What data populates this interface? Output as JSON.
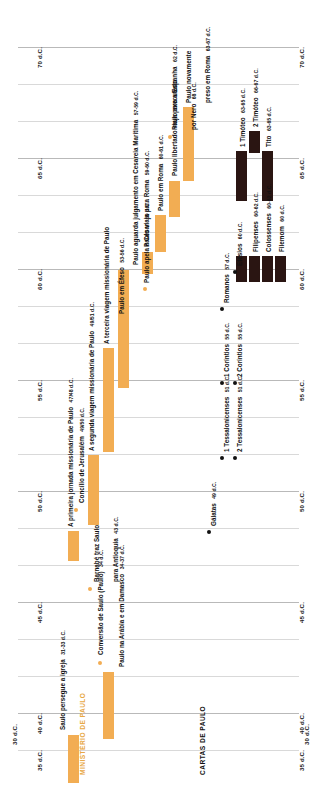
{
  "axis": {
    "unit": "d.C.",
    "ticks_left": [
      "70 d.C.",
      "65 d.C.",
      "60 d.C.",
      "55 d.C.",
      "50 d.C.",
      "45 d.C.",
      "40 d.C.",
      "35 d.C.",
      "30 d.C."
    ],
    "ticks_right": [
      "70 d.C.",
      "65 d.C.",
      "60 d.C.",
      "55 d.C.",
      "50 d.C.",
      "45 d.C.",
      "40 d.C.",
      "35 d.C.",
      "30 d.C."
    ]
  },
  "sections": {
    "ministry_title": "MINISTÉRIO DE PAULO",
    "letters_title": "CARTAS DE PAULO",
    "ministry_color": "#f2ad53",
    "letters_color": "#2a1512"
  },
  "ministry_events": [
    {
      "label": "Saulo persegue a igreja",
      "date": "31-33 d.C.",
      "marker": "bar"
    },
    {
      "label": "Conversão de Saulo (Paulo)",
      "date": "34 d.C.",
      "marker": "dot"
    },
    {
      "label": "Paulo na Arábia e em Damasco",
      "date": "34-37 d.C.",
      "marker": "bar"
    },
    {
      "label": "Barnabé traz Saulo para Antioquia",
      "date": "43 d.C.",
      "marker": "dot"
    },
    {
      "label": "A primeira jornada missionária de Paulo",
      "date": "47/48 d.C.",
      "marker": "bar"
    },
    {
      "label": "Concílio de Jerusalém",
      "date": "49/50 d.C.",
      "marker": "dot"
    },
    {
      "label": "A segunda viagem missionária de Paulo",
      "date": "49/51 d.C.",
      "marker": "bar"
    },
    {
      "label": "A terceira viagem missionária de Paulo",
      "date": "",
      "marker": "bar"
    },
    {
      "label": "Paulo em Éfeso",
      "date": "53-56 d.C.",
      "marker": "bar"
    },
    {
      "label": "Paulo aguarda julgamento em Cesareia Marítima",
      "date": "57-59 d.C.",
      "marker": "bar"
    },
    {
      "label": "Paulo apela a César",
      "date": "59 d.C.",
      "marker": "dot"
    },
    {
      "label": "Paulo viaja para Roma",
      "date": "59-60 d.C.",
      "marker": "bar"
    },
    {
      "label": "Paulo em Roma",
      "date": "60-61 d.C.",
      "marker": "bar"
    },
    {
      "label": "Paulo libertado viaja para a Espanha",
      "date": "62 d.C.",
      "marker": "bar"
    },
    {
      "label": "Paulo novamente preso em Roma",
      "date": "63-67 d.C.",
      "marker": "bar"
    },
    {
      "label": "Paulo executado por Nero",
      "date": "68 d.C.",
      "marker": "dot"
    }
  ],
  "letters": [
    {
      "label": "Gálatas",
      "date": "49 d.C."
    },
    {
      "label": "1 Tessalonicenses",
      "date": "51 d.C."
    },
    {
      "label": "2 Tessalonicenses",
      "date": "51 d.C."
    },
    {
      "label": "1 Coríntios",
      "date": "55 d.C."
    },
    {
      "label": "2 Coríntios",
      "date": "55 d.C."
    },
    {
      "label": "Romanos",
      "date": "57 d.C."
    },
    {
      "label": "Efésios",
      "date": "60 d.C."
    },
    {
      "label": "Filipenses",
      "date": "60-62 d.C."
    },
    {
      "label": "Colossenses",
      "date": "60-62 d.C."
    },
    {
      "label": "Filemom",
      "date": "60 d.C."
    },
    {
      "label": "1 Timóteo",
      "date": "63-65 d.C."
    },
    {
      "label": "2 Timóteo",
      "date": "66-67 d.C."
    },
    {
      "label": "Tito",
      "date": "63-65 d.C."
    }
  ]
}
